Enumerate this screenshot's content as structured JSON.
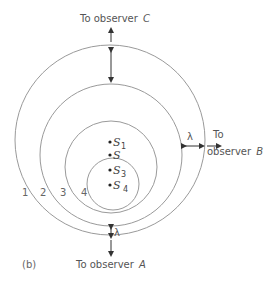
{
  "figure": {
    "panel_label": "(b)",
    "observers": {
      "C": {
        "prefix": "To observer",
        "name": "C"
      },
      "B": {
        "line1": "To",
        "line2": "observer",
        "name": "B"
      },
      "A": {
        "prefix": "To  observer",
        "name": "A"
      }
    },
    "wavelength_symbol": "λ",
    "wavefront_labels": [
      "1",
      "2",
      "3",
      "4"
    ],
    "sources": [
      {
        "base": "S",
        "sub": "1"
      },
      {
        "base": "S",
        "sub": ""
      },
      {
        "base": "S",
        "sub": "3"
      },
      {
        "base": "S",
        "sub": "4"
      }
    ]
  },
  "colors": {
    "ring": "#9a9a9a",
    "text": "#555555",
    "arrow": "#333333"
  }
}
